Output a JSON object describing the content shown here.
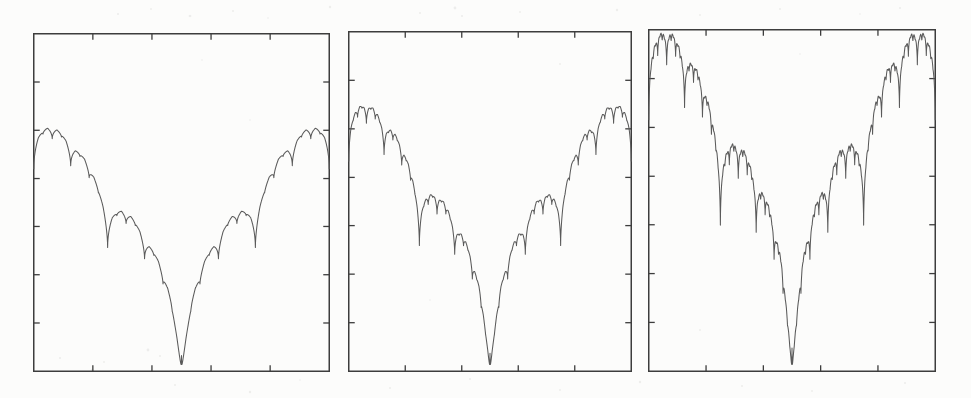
{
  "figure": {
    "title": "",
    "background_color": "#fcfcfb",
    "ink_color": "#4a4a4a",
    "axis_color": "#3d3d3d",
    "panel_count": 3,
    "caption": ""
  },
  "chart_data": {
    "type": "line",
    "title": "",
    "subtitle": "",
    "xlabel": "",
    "ylabel": "",
    "grid": false,
    "legend": null,
    "shared_axes": {
      "xlim": [
        0,
        1
      ],
      "ylim": [
        0,
        1
      ],
      "x_ticks_interior": 4,
      "y_ticks_interior": 6,
      "x_tick_positions": [
        0.2,
        0.4,
        0.6,
        0.8
      ],
      "y_tick_positions": [
        0.143,
        0.286,
        0.429,
        0.571,
        0.714,
        0.857
      ],
      "tick_labels_visible": false,
      "ticks_inward": true
    },
    "panels": [
      {
        "index": 0,
        "name": "panel-1",
        "label": "",
        "recursion_depth": 4,
        "cusp_decay": 0.52,
        "edge_value": 0.72,
        "center_min": 0.02,
        "notes": "Coarsest structure: main V plus one visible generation of side lobes."
      },
      {
        "index": 1,
        "name": "panel-2",
        "label": "",
        "recursion_depth": 5,
        "cusp_decay": 0.56,
        "edge_value": 0.78,
        "center_min": 0.02,
        "notes": "Intermediate structure: additional sub-lobes resolved on each branch."
      },
      {
        "index": 2,
        "name": "panel-3",
        "label": "",
        "recursion_depth": 6,
        "cusp_decay": 0.6,
        "edge_value": 0.99,
        "center_min": 0.02,
        "notes": "Finest structure: curve rises to the top corners, densest nested cusps."
      }
    ],
    "x": [
      0.0,
      0.1,
      0.2,
      0.25,
      0.3,
      0.35,
      0.4,
      0.45,
      0.5,
      0.55,
      0.6,
      0.65,
      0.7,
      0.75,
      0.8,
      0.9,
      1.0
    ],
    "series": [
      {
        "name": "panel-1-curve",
        "values": [
          0.72,
          0.66,
          0.55,
          0.47,
          0.4,
          0.3,
          0.22,
          0.14,
          0.02,
          0.14,
          0.22,
          0.3,
          0.4,
          0.47,
          0.55,
          0.66,
          0.72
        ]
      },
      {
        "name": "panel-2-curve",
        "values": [
          0.78,
          0.71,
          0.6,
          0.51,
          0.43,
          0.32,
          0.24,
          0.15,
          0.02,
          0.15,
          0.24,
          0.32,
          0.43,
          0.51,
          0.6,
          0.71,
          0.78
        ]
      },
      {
        "name": "panel-3-curve",
        "values": [
          0.99,
          0.86,
          0.7,
          0.58,
          0.48,
          0.36,
          0.26,
          0.16,
          0.02,
          0.16,
          0.26,
          0.36,
          0.48,
          0.58,
          0.7,
          0.86,
          0.99
        ]
      }
    ]
  },
  "panel_geometry": [
    {
      "name": "panel-1",
      "left": 33,
      "top": 33,
      "width": 297,
      "height": 339
    },
    {
      "name": "panel-2",
      "left": 348,
      "top": 31,
      "width": 284,
      "height": 341
    },
    {
      "name": "panel-3",
      "left": 648,
      "top": 29,
      "width": 288,
      "height": 343
    }
  ]
}
